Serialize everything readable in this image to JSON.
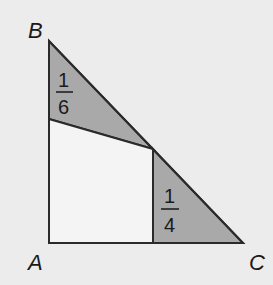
{
  "diagram": {
    "vertices": {
      "A": "A",
      "B": "B",
      "C": "C"
    },
    "regions": [
      {
        "name": "top-shaded-triangle",
        "numerator": "1",
        "denominator": "6"
      },
      {
        "name": "right-shaded-triangle",
        "numerator": "1",
        "denominator": "4"
      }
    ],
    "colors": {
      "background": "#ececec",
      "shaded": "#a9a9a9",
      "unshaded": "#f2f2f2",
      "stroke": "#2a2a2a"
    }
  }
}
